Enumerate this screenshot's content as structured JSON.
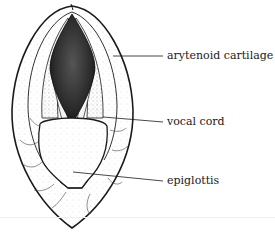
{
  "diagram": {
    "labels": [
      {
        "id": "arytenoid",
        "text": "arytenoid cartilage"
      },
      {
        "id": "vocal-cord",
        "text": "vocal cord"
      },
      {
        "id": "epiglottis",
        "text": "epiglottis"
      }
    ]
  },
  "colors": {
    "ink": "#1a1a1a",
    "background": "#ffffff",
    "glottis": "#2a2a2a"
  }
}
